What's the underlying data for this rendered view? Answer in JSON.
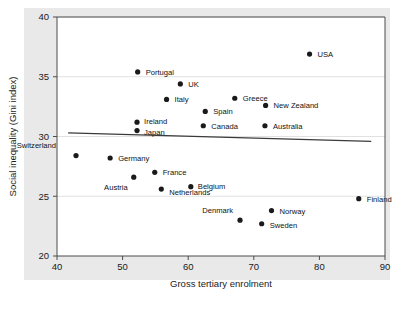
{
  "chart_data": {
    "type": "scatter",
    "title": "",
    "xlabel": "Gross tertiary enrolment",
    "ylabel": "Social inequality (Gini index)",
    "xlim": [
      40,
      90
    ],
    "ylim": [
      20,
      40
    ],
    "xticks": [
      40,
      50,
      60,
      70,
      80,
      90
    ],
    "yticks": [
      20,
      25,
      30,
      35,
      40
    ],
    "grid": true,
    "legend": "none",
    "point_color": "#1a1a1a",
    "trendline_color": "#3a3a3a",
    "panel_color": "#e9e9e9",
    "points": [
      {
        "label": "USA",
        "x": 78.5,
        "y": 36.9,
        "lx": 8,
        "ly": 3
      },
      {
        "label": "Portugal",
        "x": 52.3,
        "y": 35.4,
        "lx": 8,
        "ly": 3
      },
      {
        "label": "UK",
        "x": 58.8,
        "y": 34.4,
        "lx": 8,
        "ly": 3
      },
      {
        "label": "Italy",
        "x": 56.7,
        "y": 33.1,
        "lx": 8,
        "ly": 3
      },
      {
        "label": "Greece",
        "x": 67.1,
        "y": 33.2,
        "lx": 8,
        "ly": 3
      },
      {
        "label": "New Zealand",
        "x": 71.8,
        "y": 32.6,
        "lx": 8,
        "ly": 3
      },
      {
        "label": "Spain",
        "x": 62.6,
        "y": 32.1,
        "lx": 8,
        "ly": 3
      },
      {
        "label": "Australia",
        "x": 71.7,
        "y": 30.9,
        "lx": 8,
        "ly": 3
      },
      {
        "label": "Canada",
        "x": 62.3,
        "y": 30.9,
        "lx": 8,
        "ly": 3
      },
      {
        "label": "Ireland",
        "x": 52.2,
        "y": 31.2,
        "lx": 7,
        "ly": 2
      },
      {
        "label": "Japan",
        "x": 52.2,
        "y": 30.5,
        "lx": 7,
        "ly": 4
      },
      {
        "label": "Switzerland",
        "x": 42.9,
        "y": 28.4,
        "lx": -20,
        "ly": -8
      },
      {
        "label": "Germany",
        "x": 48.1,
        "y": 28.2,
        "lx": 8,
        "ly": 3
      },
      {
        "label": "Austria",
        "x": 51.7,
        "y": 26.6,
        "lx": -6,
        "ly": 13
      },
      {
        "label": "France",
        "x": 54.9,
        "y": 27.0,
        "lx": 8,
        "ly": 3
      },
      {
        "label": "Netherlands",
        "x": 55.9,
        "y": 25.6,
        "lx": 8,
        "ly": 6
      },
      {
        "label": "Belgium",
        "x": 60.4,
        "y": 25.8,
        "lx": 7,
        "ly": 2
      },
      {
        "label": "Finland",
        "x": 86.0,
        "y": 24.8,
        "lx": 8,
        "ly": 3
      },
      {
        "label": "Norway",
        "x": 72.7,
        "y": 23.8,
        "lx": 8,
        "ly": 3
      },
      {
        "label": "Denmark",
        "x": 67.9,
        "y": 23.0,
        "lx": -7,
        "ly": -7
      },
      {
        "label": "Sweden",
        "x": 71.2,
        "y": 22.7,
        "lx": 8,
        "ly": 4
      }
    ],
    "trendline": {
      "x1": 41.7,
      "y1": 30.3,
      "x2": 87.9,
      "y2": 29.6
    }
  }
}
